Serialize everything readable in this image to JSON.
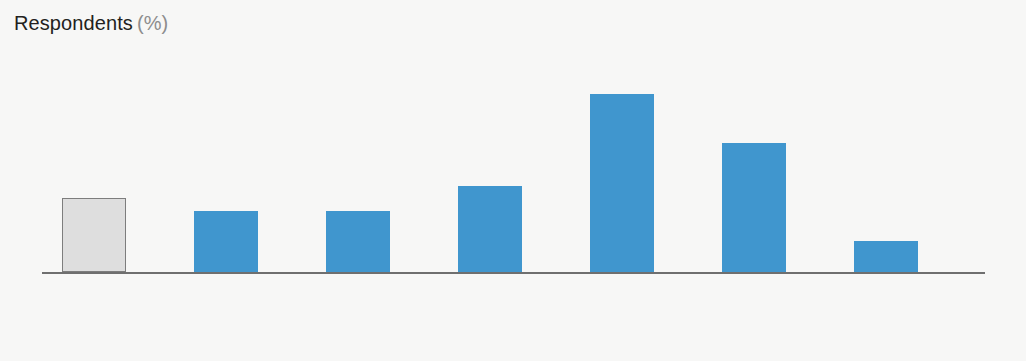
{
  "chart_data": {
    "type": "bar",
    "title": "Respondents",
    "title_unit": "(%)",
    "xlabel": "",
    "ylabel": "Respondents (%)",
    "ylim": [
      0,
      30
    ],
    "grid": false,
    "legend": "none",
    "categories": [
      "N/A or don’t know",
      "No increase",
      "Increase 0%–10%",
      "Increase 10%–25%",
      "Increase 25%–50%",
      "Increase 50%–100%",
      "Increase >100%"
    ],
    "category_lines": [
      [
        "N/A or",
        "don’t know"
      ],
      [
        "No increase",
        ""
      ],
      [
        "Increase",
        "0%–10%"
      ],
      [
        "Increase",
        "10%–25%"
      ],
      [
        "Increase",
        "25%–50%"
      ],
      [
        "Increase",
        "50%–100%"
      ],
      [
        "Increase",
        ">100%"
      ]
    ],
    "values": [
      12,
      10,
      10,
      14,
      29,
      21,
      5
    ],
    "value_labels": [
      "12",
      "10",
      "10",
      "14",
      "29",
      "21",
      "5"
    ],
    "bar_colors": [
      "#dedede",
      "#4096ce",
      "#4096ce",
      "#4096ce",
      "#4096ce",
      "#4096ce",
      "#4096ce"
    ],
    "bar_styles": [
      "gray",
      "blue",
      "blue",
      "blue",
      "blue",
      "blue",
      "blue"
    ],
    "colors": {
      "blue": "#4096ce",
      "gray_fill": "#dedede",
      "gray_stroke": "#7d7d7d",
      "axis": "#6f6f6f",
      "text": "#231f20",
      "unit_text": "#8d8d8d",
      "background": "#f7f7f6"
    }
  }
}
